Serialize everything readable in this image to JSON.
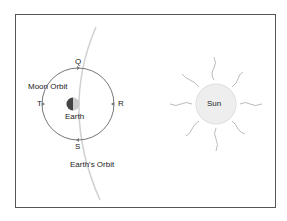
{
  "labels": {
    "q": "Q",
    "r": "R",
    "s": "S",
    "t": "T",
    "moon_orbit": "Moon Orbit",
    "earth": "Earth",
    "earths_orbit": "Earth's Orbit",
    "sun": "Sun"
  },
  "colors": {
    "frame": "#555555",
    "orbit_line": "#777777",
    "earth_orbit": "#cccccc",
    "sun_fill": "#eeeeee",
    "sun_rays": "#aaaaaa",
    "earth_dark": "#444444",
    "earth_light": "#cccccc"
  }
}
